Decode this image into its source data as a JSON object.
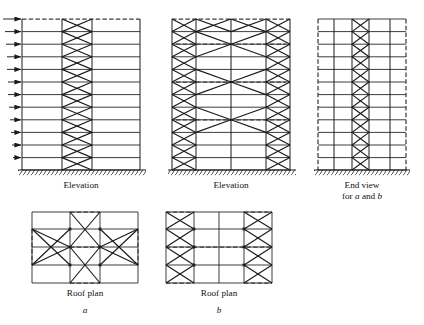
{
  "figure": {
    "domain": "structural-engineering-diagram",
    "background_color": "#ffffff",
    "line_color": "#1a1a1a",
    "dash_color": "#555555"
  },
  "captions": {
    "elevation_a": "Elevation",
    "elevation_b": "Elevation",
    "end_view_line1": "End view",
    "end_view_line2_prefix": "for ",
    "end_view_line2_a": "a",
    "end_view_line2_mid": " and ",
    "end_view_line2_b": "b",
    "roof_plan_a": "Roof plan",
    "roof_plan_b": "Roof plan",
    "label_a": "a",
    "label_b": "b"
  },
  "panels": [
    {
      "id": "elevation-a",
      "caption": "Elevation",
      "scheme_letter": "a",
      "stories": 12,
      "bays": 3,
      "braced_bay_index": 1,
      "brace_type": "X-bracing",
      "braced_stories": 12,
      "lateral_load_arrows": 12,
      "arrow_direction": "right",
      "base_support": "hatched-fixed-ground",
      "top_edge_style": "dashed"
    },
    {
      "id": "elevation-b",
      "caption": "Elevation",
      "scheme_letter": "b",
      "stories": 12,
      "bays": 3,
      "braced_bay_indices": [
        0,
        2
      ],
      "brace_type": "X-bracing in end bays plus outrigger/belt trusses",
      "outrigger_levels": [
        3,
        6,
        9,
        12
      ],
      "base_support": "hatched-fixed-ground",
      "top_edge_style": "dashed"
    },
    {
      "id": "end-view",
      "caption_line1": "End view",
      "caption_line2": "for a and b",
      "stories": 12,
      "bays": 4,
      "braced_bay_index": 2,
      "brace_type": "X-bracing in narrow core bay",
      "side_edge_style": "dashed",
      "base_support": "hatched-fixed-ground"
    },
    {
      "id": "roof-plan-a",
      "caption": "Roof plan",
      "scheme_letter": "a",
      "bays_x": 3,
      "bays_y": 4,
      "brace_type": "central X-braced core with radiating diagonals to end bays",
      "dashed_edges": [
        "left",
        "right",
        "top-center",
        "bottom-center"
      ]
    },
    {
      "id": "roof-plan-b",
      "caption": "Roof plan",
      "scheme_letter": "b",
      "bays_x": 3,
      "bays_y": 4,
      "brace_type": "X-bracing in left and right end bays",
      "dashed_edges": [
        "left",
        "right",
        "top-left",
        "top-right",
        "bottom-left",
        "bottom-right"
      ]
    }
  ]
}
